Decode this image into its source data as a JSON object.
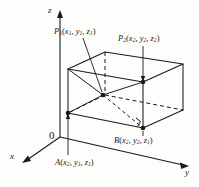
{
  "figure": {
    "background_color": "#fdfdfc",
    "ink_color": "#1a1a1a"
  },
  "axes": {
    "x_label": "x",
    "y_label": "y",
    "z_label": "z",
    "origin_label": "0"
  },
  "points": {
    "p1": {
      "name": "P",
      "index": "1",
      "coord_x": "x",
      "coord_x_sub": "1",
      "coord_y": "y",
      "coord_y_sub": "1",
      "coord_z": "z",
      "coord_z_sub": "1"
    },
    "p2": {
      "name": "P",
      "index": "2",
      "coord_x": "x",
      "coord_x_sub": "2",
      "coord_y": "y",
      "coord_y_sub": "2",
      "coord_z": "z",
      "coord_z_sub": "2"
    },
    "a": {
      "name": "A",
      "index": "",
      "coord_x": "x",
      "coord_x_sub": "2",
      "coord_y": "y",
      "coord_y_sub": "1",
      "coord_z": "z",
      "coord_z_sub": "1"
    },
    "b": {
      "name": "B",
      "index": "",
      "coord_x": "x",
      "coord_x_sub": "2",
      "coord_y": "y",
      "coord_y_sub": "2",
      "coord_z": "z",
      "coord_z_sub": "1"
    }
  },
  "punctuation": {
    "open_paren": "(",
    "close_paren": ")",
    "comma": ", "
  }
}
